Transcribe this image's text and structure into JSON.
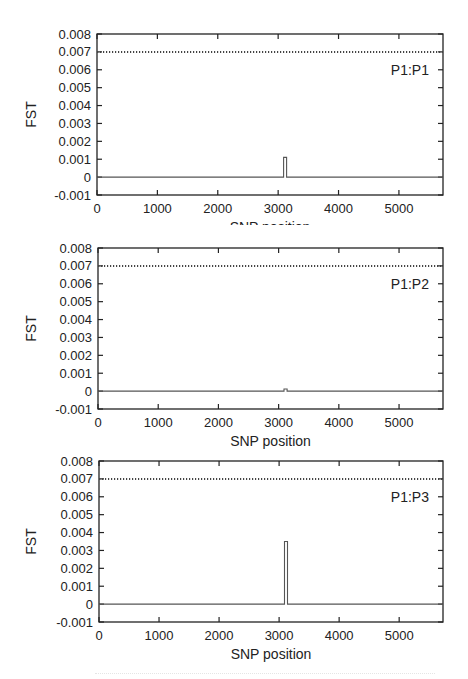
{
  "figure": {
    "panels": [
      {
        "label": "P1:P1"
      },
      {
        "label": "P1:P2"
      },
      {
        "label": "P1:P3"
      }
    ]
  },
  "colors": {
    "axis": "#222222",
    "line": "#555555",
    "threshold": "#444444",
    "background": "#ffffff"
  },
  "chart_data": [
    {
      "type": "line",
      "title": "",
      "legend": "P1:P1",
      "xlabel": "SNP position",
      "ylabel": "FST",
      "xlim": [
        0,
        5730
      ],
      "ylim": [
        -0.001,
        0.008
      ],
      "xticks": [
        0,
        1000,
        2000,
        3000,
        4000,
        5000
      ],
      "xtick_labels": [
        "0",
        "1000",
        "2000",
        "3000",
        "4000",
        "5000"
      ],
      "yticks": [
        -0.001,
        0,
        0.001,
        0.002,
        0.003,
        0.004,
        0.005,
        0.006,
        0.007,
        0.008
      ],
      "ytick_labels": [
        "-0.001",
        "0",
        "0.001",
        "0.002",
        "0.003",
        "0.004",
        "0.005",
        "0.006",
        "0.007",
        "0.008"
      ],
      "grid": false,
      "legend_position": "upper right (inside)",
      "series": [
        {
          "name": "FST",
          "style": "solid",
          "x": [
            0,
            3090,
            3090,
            3140,
            3140,
            5730
          ],
          "y": [
            0,
            0,
            0.0011,
            0.0011,
            0,
            0
          ]
        },
        {
          "name": "threshold",
          "style": "dotted",
          "x": [
            0,
            5730
          ],
          "y": [
            0.007,
            0.007
          ]
        }
      ]
    },
    {
      "type": "line",
      "title": "",
      "legend": "P1:P2",
      "xlabel": "SNP position",
      "ylabel": "FST",
      "xlim": [
        0,
        5730
      ],
      "ylim": [
        -0.001,
        0.008
      ],
      "xticks": [
        0,
        1000,
        2000,
        3000,
        4000,
        5000
      ],
      "xtick_labels": [
        "0",
        "1000",
        "2000",
        "3000",
        "4000",
        "5000"
      ],
      "yticks": [
        -0.001,
        0,
        0.001,
        0.002,
        0.003,
        0.004,
        0.005,
        0.006,
        0.007,
        0.008
      ],
      "ytick_labels": [
        "-0.001",
        "0",
        "0.001",
        "0.002",
        "0.003",
        "0.004",
        "0.005",
        "0.006",
        "0.007",
        "0.008"
      ],
      "grid": false,
      "legend_position": "upper right (inside)",
      "series": [
        {
          "name": "FST",
          "style": "solid",
          "x": [
            0,
            3090,
            3090,
            3140,
            3140,
            5730
          ],
          "y": [
            0,
            0,
            0.00012,
            0.00012,
            0,
            0
          ]
        },
        {
          "name": "threshold",
          "style": "dotted",
          "x": [
            0,
            5730
          ],
          "y": [
            0.007,
            0.007
          ]
        }
      ]
    },
    {
      "type": "line",
      "title": "",
      "legend": "P1:P3",
      "xlabel": "SNP position",
      "ylabel": "FST",
      "xlim": [
        0,
        5730
      ],
      "ylim": [
        -0.001,
        0.008
      ],
      "xticks": [
        0,
        1000,
        2000,
        3000,
        4000,
        5000
      ],
      "xtick_labels": [
        "0",
        "1000",
        "2000",
        "3000",
        "4000",
        "5000"
      ],
      "yticks": [
        -0.001,
        0,
        0.001,
        0.002,
        0.003,
        0.004,
        0.005,
        0.006,
        0.007,
        0.008
      ],
      "ytick_labels": [
        "-0.001",
        "0",
        "0.001",
        "0.002",
        "0.003",
        "0.004",
        "0.005",
        "0.006",
        "0.007",
        "0.008"
      ],
      "grid": false,
      "legend_position": "upper right (inside)",
      "series": [
        {
          "name": "FST",
          "style": "solid",
          "x": [
            0,
            3090,
            3090,
            3140,
            3140,
            5730
          ],
          "y": [
            0,
            0,
            0.0035,
            0.0035,
            0,
            0
          ]
        },
        {
          "name": "threshold",
          "style": "dotted",
          "x": [
            0,
            5730
          ],
          "y": [
            0.007,
            0.007
          ]
        }
      ]
    }
  ]
}
